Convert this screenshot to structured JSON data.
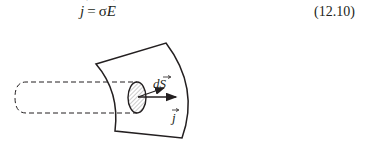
{
  "equation": {
    "lhs_symbol": "j",
    "equals": "=",
    "sigma": "σ",
    "rhs_symbol": "E",
    "number": "(12.10)"
  },
  "figure": {
    "labels": {
      "surface_element": "dS",
      "current_density": "j"
    },
    "elements": [
      "dashed-current-tube",
      "curved-surface-patch",
      "hatched-ellipse-area-element",
      "normal-vector-arrow-dS",
      "current-density-arrow-j"
    ],
    "colors": {
      "line": "#231f20",
      "hatch": "#9a9a9a",
      "fill": "#ffffff"
    }
  }
}
